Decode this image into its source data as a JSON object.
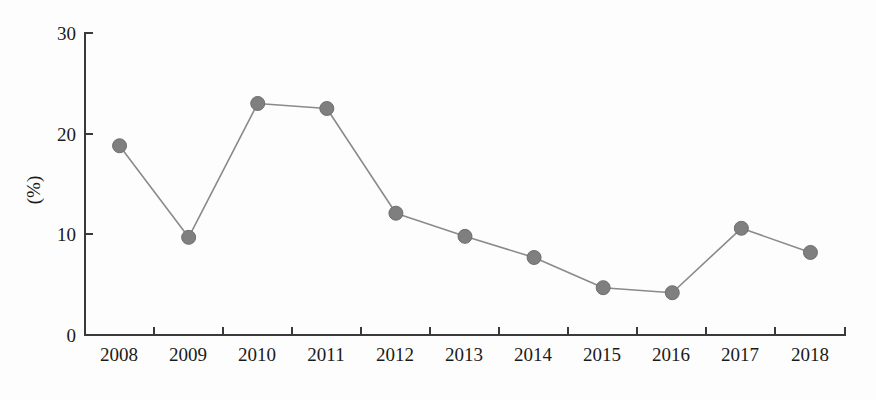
{
  "chart_data": {
    "type": "line",
    "title": "",
    "xlabel": "",
    "ylabel": "(%)",
    "categories": [
      "2008",
      "2009",
      "2010",
      "2011",
      "2012",
      "2013",
      "2014",
      "2015",
      "2016",
      "2017",
      "2018"
    ],
    "values": [
      18.8,
      9.7,
      23.0,
      22.5,
      12.1,
      9.8,
      7.7,
      4.7,
      4.2,
      10.6,
      8.2
    ],
    "series": [
      {
        "name": "",
        "values": [
          18.8,
          9.7,
          23.0,
          22.5,
          12.1,
          9.8,
          7.7,
          4.7,
          4.2,
          10.6,
          8.2
        ]
      }
    ],
    "ylim": [
      0,
      30
    ],
    "yticks": [
      "0",
      "10",
      "20",
      "30"
    ],
    "ytick_values": [
      0,
      10,
      20,
      30
    ],
    "xticks": [
      "2008",
      "2009",
      "2010",
      "2011",
      "2012",
      "2013",
      "2014",
      "2015",
      "2016",
      "2017",
      "2018"
    ],
    "grid": false,
    "legend": false,
    "legend_position": "none",
    "marker": "filled-circle",
    "colors": {
      "line": "#8a8a8a",
      "marker": "#7f7f7f",
      "axis": "#3a3a3a",
      "text": "#1a1a1a",
      "background": "#fdfdfd"
    }
  }
}
